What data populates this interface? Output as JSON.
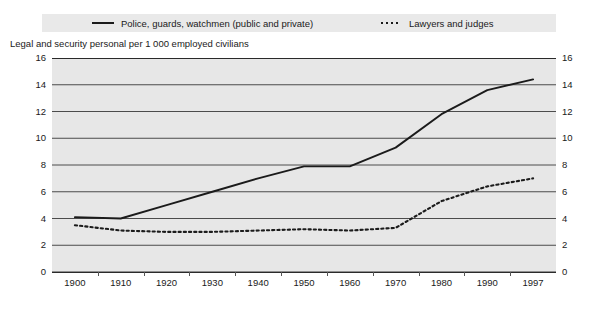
{
  "chart_data": {
    "type": "line",
    "title": "",
    "subtitle": "",
    "ylabel": "Legal and security personal per 1 000 employed civilians",
    "xlabel": "",
    "categories": [
      "1900",
      "1910",
      "1920",
      "1930",
      "1940",
      "1950",
      "1960",
      "1970",
      "1980",
      "1990",
      "1997"
    ],
    "x": [
      1900,
      1910,
      1920,
      1930,
      1940,
      1950,
      1960,
      1970,
      1980,
      1990,
      1997
    ],
    "ylim": [
      0,
      16
    ],
    "yticks": [
      0,
      2,
      4,
      6,
      8,
      10,
      12,
      14,
      16
    ],
    "ytick_labels": [
      "0",
      "2",
      "4",
      "6",
      "8",
      "10",
      "12",
      "14",
      "16"
    ],
    "grid": true,
    "grid_axis": "y",
    "legend_position": "top",
    "series": [
      {
        "name": "Police, guards, watchmen (public and private)",
        "style": "solid",
        "color": "#1b1b1b",
        "values": [
          4.1,
          4.0,
          5.0,
          6.0,
          7.0,
          7.9,
          7.9,
          9.3,
          11.8,
          13.6,
          14.4
        ]
      },
      {
        "name": "Lawyers and judges",
        "style": "dotted",
        "color": "#1b1b1b",
        "values": [
          3.5,
          3.1,
          3.0,
          3.0,
          3.1,
          3.2,
          3.1,
          3.3,
          5.3,
          6.4,
          7.0
        ]
      }
    ]
  },
  "legend": {
    "entries": [
      {
        "label": "Police, guards, watchmen (public and private)",
        "style": "solid",
        "icon": "solid-line-icon"
      },
      {
        "label": "Lawyers and judges",
        "style": "dotted",
        "icon": "dotted-line-icon"
      }
    ]
  },
  "axis": {
    "title": "Legal and security personal per 1 000 employed civilians",
    "y_left_labels": [
      "16",
      "14",
      "12",
      "10",
      "8",
      "6",
      "4",
      "2",
      "0"
    ],
    "y_right_labels": [
      "16",
      "14",
      "12",
      "10",
      "8",
      "6",
      "4",
      "2",
      "0"
    ],
    "x_labels": [
      "1900",
      "1910",
      "1920",
      "1930",
      "1940",
      "1950",
      "1960",
      "1970",
      "1980",
      "1990",
      "1997"
    ]
  }
}
